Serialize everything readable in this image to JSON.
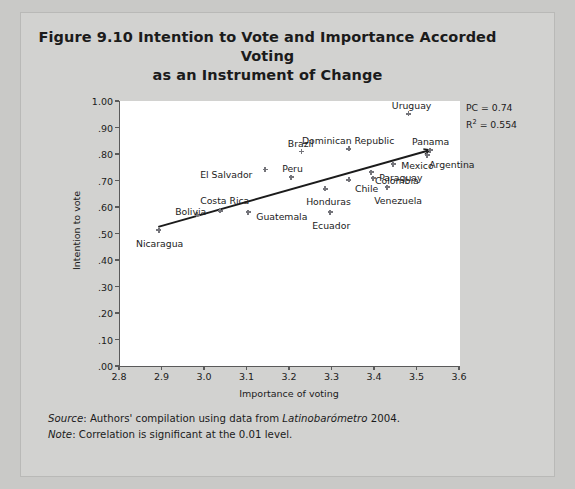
{
  "figure": {
    "title": "Figure 9.10 Intention to Vote and Importance Accorded Voting as an Instrument of Change",
    "title_line1": "Figure 9.10 Intention to Vote and Importance Accorded Voting",
    "title_line2": "as an Instrument of Change",
    "source_label": "Source",
    "source_text": ": Authors' compilation using data from ",
    "source_italic": "Latinobarómetro",
    "source_year": " 2004.",
    "note_label": "Note",
    "note_text": ": Correlation is significant at the 0.01 level."
  },
  "annotations": {
    "pc": "PC = 0.74",
    "r2_prefix": "R",
    "r2_sup": "2",
    "r2_value": " = 0.554"
  },
  "colors": {
    "page_background": "#c9c9c7",
    "figure_background": "#d2d2d0",
    "plot_background": "#ffffff",
    "axis": "#5a5a5a",
    "marker": "#74747a",
    "trendline": "#1b1b1b",
    "text": "#1b1b1b"
  },
  "chart_data": {
    "type": "scatter",
    "title": "Figure 9.10 Intention to Vote and Importance Accorded Voting as an Instrument of Change",
    "xlabel": "Importance of voting",
    "ylabel": "Intention to vote",
    "xlim": [
      2.8,
      3.6
    ],
    "ylim": [
      0.0,
      1.0
    ],
    "xticks": [
      "2.8",
      "2.9",
      "3.0",
      "3.1",
      "3.2",
      "3.3",
      "3.4",
      "3.5",
      "3.6"
    ],
    "xtick_values": [
      2.8,
      2.9,
      3.0,
      3.1,
      3.2,
      3.3,
      3.4,
      3.5,
      3.6
    ],
    "yticks": [
      "1.00",
      ".90",
      ".80",
      ".70",
      ".60",
      ".50",
      ".40",
      ".30",
      ".20",
      ".10",
      ".00"
    ],
    "ytick_values": [
      1.0,
      0.9,
      0.8,
      0.7,
      0.6,
      0.5,
      0.4,
      0.3,
      0.2,
      0.1,
      0.0
    ],
    "grid": false,
    "legend": "none",
    "trendline": {
      "x0": 2.89,
      "y0": 0.525,
      "x1": 3.53,
      "y1": 0.815,
      "arrow": true
    },
    "points": [
      {
        "label": "Nicaragua",
        "x": 2.894,
        "y": 0.513,
        "lx": -23,
        "ly": 13
      },
      {
        "label": "Bolivia",
        "x": 2.984,
        "y": 0.57,
        "lx": -22,
        "ly": -4
      },
      {
        "label": "Costa Rica",
        "x": 3.038,
        "y": 0.585,
        "lx": -20,
        "ly": -11
      },
      {
        "label": "Guatemala",
        "x": 3.104,
        "y": 0.581,
        "lx": 8,
        "ly": 4
      },
      {
        "label": "El Salvador",
        "x": 3.144,
        "y": 0.74,
        "lx": -65,
        "ly": 4
      },
      {
        "label": "Peru",
        "x": 3.205,
        "y": 0.713,
        "lx": -9,
        "ly": -9
      },
      {
        "label": "Brazil",
        "x": 3.23,
        "y": 0.808,
        "lx": -14,
        "ly": -9
      },
      {
        "label": "Honduras",
        "x": 3.285,
        "y": 0.668,
        "lx": -19,
        "ly": 12
      },
      {
        "label": "Ecuador",
        "x": 3.297,
        "y": 0.581,
        "lx": -18,
        "ly": 13
      },
      {
        "label": "Dominican Republic",
        "x": 3.341,
        "y": 0.819,
        "lx": -47,
        "ly": -9
      },
      {
        "label": "Chile",
        "x": 3.341,
        "y": 0.702,
        "lx": 6,
        "ly": 8
      },
      {
        "label": "Colombia",
        "x": 3.393,
        "y": 0.732,
        "lx": 4,
        "ly": 8
      },
      {
        "label": "Paraguay",
        "x": 3.398,
        "y": 0.709,
        "lx": 6,
        "ly": -1
      },
      {
        "label": "Venezuela",
        "x": 3.431,
        "y": 0.675,
        "lx": -13,
        "ly": 13
      },
      {
        "label": "Mexico",
        "x": 3.445,
        "y": 0.762,
        "lx": 8,
        "ly": 1
      },
      {
        "label": "Uruguay",
        "x": 3.482,
        "y": 0.951,
        "lx": -17,
        "ly": -9
      },
      {
        "label": "Argentina",
        "x": 3.525,
        "y": 0.796,
        "lx": 2,
        "ly": 9
      },
      {
        "label": "Panama",
        "x": 3.532,
        "y": 0.815,
        "lx": -18,
        "ly": -9
      }
    ]
  }
}
